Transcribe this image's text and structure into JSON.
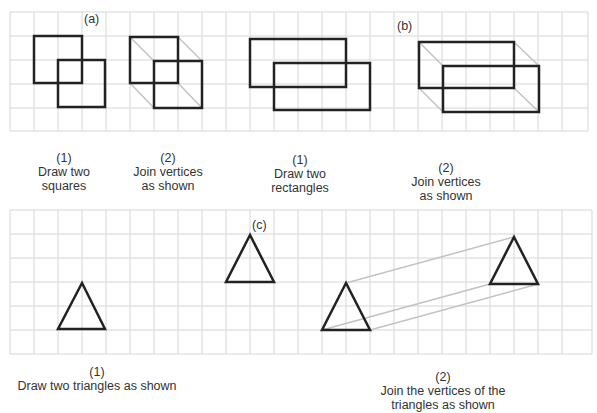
{
  "figure_a": {
    "label": "(a)",
    "step1": {
      "num": "(1)",
      "line1": "Draw two",
      "line2": "squares"
    },
    "step2": {
      "num": "(2)",
      "line1": "Join vertices",
      "line2": "as shown"
    }
  },
  "figure_b": {
    "label": "(b)",
    "step1": {
      "num": "(1)",
      "line1": "Draw two",
      "line2": "rectangles"
    },
    "step2": {
      "num": "(2)",
      "line1": "Join vertices",
      "line2": "as shown"
    }
  },
  "figure_c": {
    "label": "(c)",
    "step1": {
      "num": "(1)",
      "line1": "Draw two triangles as shown"
    },
    "step2": {
      "num": "(2)",
      "line1": "Join the vertices of the",
      "line2": "triangles  as  shown"
    }
  },
  "colors": {
    "grid": "#d4d4d4",
    "shape": "#222222",
    "join": "#bdbdbd"
  }
}
